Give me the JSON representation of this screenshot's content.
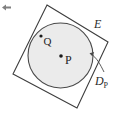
{
  "figure": {
    "background_color": "#ffffff",
    "cursor_marker": {
      "icon": "left-arrow-icon",
      "color": "#7a7a7a",
      "x": 3,
      "y": 7
    },
    "labels": {
      "set_E": "E",
      "disk_main": "D",
      "disk_subscript": "P",
      "point_center": "P",
      "point_inner": "Q"
    },
    "shapes": {
      "square": {
        "name": "square-E",
        "stroke_color": "#3d3d3d",
        "fill_color": "none",
        "stroke_width": 1.1,
        "points": "47,5 108,42 77,108 13,74"
      },
      "circle": {
        "name": "disk-DP",
        "stroke_color": "#4a4a4a",
        "fill_color": "#ebebeb",
        "stroke_width": 1.1,
        "cx": 60.5,
        "cy": 55.5,
        "r": 32.5
      },
      "center_dot": {
        "name": "point-P",
        "cx": 61,
        "cy": 56,
        "r": 1.7,
        "color": "#1a1a1a"
      },
      "inner_dot": {
        "name": "point-Q",
        "cx": 41,
        "cy": 36,
        "r": 1.6,
        "color": "#1a1a1a"
      },
      "leader": {
        "name": "disk-leader-line",
        "color": "#4a4a4a",
        "path": "M 104,72 C 100,64 97,58 90,53",
        "arrow": "M 90,53 L 94,52 L 92,56 Z"
      }
    },
    "label_positions": {
      "set_E": {
        "x": 95,
        "y": 27
      },
      "disk_main": {
        "x": 96,
        "y": 84
      },
      "disk_subscript": {
        "x": 105,
        "y": 87
      },
      "point_center": {
        "x": 65,
        "y": 63
      },
      "point_inner": {
        "x": 44,
        "y": 44
      }
    }
  }
}
